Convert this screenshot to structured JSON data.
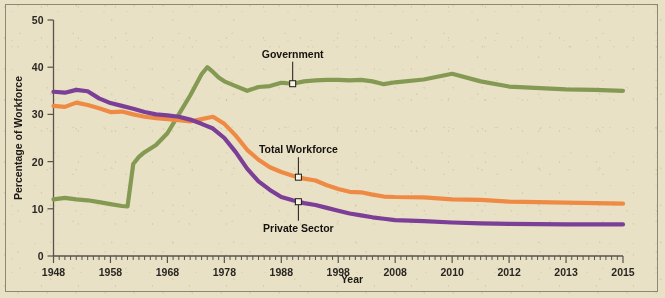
{
  "chart_data": {
    "type": "line",
    "title": "",
    "xlabel": "Year",
    "ylabel": "Percentage of Workforce",
    "ylim": [
      0,
      50
    ],
    "yticks": [
      0,
      10,
      20,
      30,
      40,
      50
    ],
    "ytick_labels": [
      "0",
      "10",
      "20",
      "30",
      "40",
      "50"
    ],
    "xtick_labels": [
      "1948",
      "1958",
      "1968",
      "1978",
      "1988",
      "1998",
      "2008",
      "2010",
      "2012",
      "2013",
      "2015"
    ],
    "grid": false,
    "legend": "inline-annotations",
    "background_color": "#e9e1c6",
    "series": [
      {
        "name": "Government",
        "color": "#849a52",
        "label_text": "Government",
        "x": [
          1948,
          1950,
          1952,
          1954,
          1956,
          1958,
          1960,
          1961,
          1962,
          1963,
          1964,
          1966,
          1968,
          1970,
          1972,
          1974,
          1975,
          1976,
          1977,
          1978,
          1980,
          1982,
          1984,
          1986,
          1988,
          1990,
          1992,
          1994,
          1996,
          1998,
          2000,
          2002,
          2004,
          2006,
          2008,
          2009,
          2010,
          2011,
          2012,
          2013,
          2014,
          2015
        ],
        "values": [
          12.0,
          12.3,
          12.0,
          11.8,
          11.4,
          11.0,
          10.6,
          10.5,
          19.5,
          21.0,
          22.0,
          23.5,
          26.0,
          30.0,
          34.0,
          38.5,
          40.0,
          39.0,
          37.8,
          37.0,
          36.0,
          35.0,
          35.8,
          36.0,
          36.7,
          36.5,
          37.0,
          37.2,
          37.3,
          37.3,
          37.2,
          37.3,
          37.0,
          36.4,
          36.8,
          37.4,
          38.6,
          37.0,
          35.9,
          35.3,
          35.2,
          35.0
        ]
      },
      {
        "name": "Total Workforce",
        "color": "#ef8a44",
        "label_text": "Total Workforce",
        "x": [
          1948,
          1950,
          1952,
          1954,
          1956,
          1958,
          1960,
          1962,
          1964,
          1966,
          1968,
          1970,
          1972,
          1974,
          1976,
          1978,
          1980,
          1982,
          1984,
          1986,
          1988,
          1990,
          1992,
          1994,
          1996,
          1998,
          2000,
          2002,
          2004,
          2006,
          2008,
          2009,
          2010,
          2011,
          2012,
          2013,
          2014,
          2015
        ],
        "values": [
          31.8,
          31.6,
          32.5,
          32.0,
          31.3,
          30.5,
          30.6,
          30.0,
          29.5,
          29.2,
          29.0,
          28.8,
          28.5,
          29.0,
          29.5,
          28.0,
          25.5,
          22.5,
          20.4,
          18.8,
          17.8,
          17.0,
          16.4,
          16.0,
          15.0,
          14.2,
          13.6,
          13.5,
          13.0,
          12.6,
          12.5,
          12.4,
          12.0,
          11.9,
          11.5,
          11.3,
          11.2,
          11.1
        ]
      },
      {
        "name": "Private Sector",
        "color": "#7b3f97",
        "label_text": "Private Sector",
        "x": [
          1948,
          1950,
          1952,
          1954,
          1956,
          1958,
          1960,
          1962,
          1964,
          1966,
          1968,
          1970,
          1972,
          1974,
          1976,
          1978,
          1980,
          1982,
          1984,
          1986,
          1988,
          1990,
          1992,
          1994,
          1996,
          1998,
          2000,
          2002,
          2004,
          2006,
          2008,
          2009,
          2010,
          2011,
          2012,
          2013,
          2014,
          2015
        ],
        "values": [
          34.8,
          34.6,
          35.2,
          34.9,
          33.4,
          32.4,
          31.8,
          31.2,
          30.5,
          30.0,
          29.8,
          29.5,
          28.9,
          28.0,
          27.0,
          25.0,
          22.0,
          18.5,
          15.8,
          14.0,
          12.5,
          11.8,
          11.2,
          10.8,
          10.2,
          9.6,
          9.0,
          8.6,
          8.2,
          7.9,
          7.6,
          7.4,
          7.1,
          6.9,
          6.8,
          6.7,
          6.7,
          6.7
        ]
      }
    ],
    "annotations": [
      {
        "series": "Government",
        "text": "Government",
        "point_year": 1990,
        "point_value": 36.5
      },
      {
        "series": "Total Workforce",
        "text": "Total Workforce",
        "point_year": 1991,
        "point_value": 16.7
      },
      {
        "series": "Private Sector",
        "text": "Private Sector",
        "point_year": 1991,
        "point_value": 11.5
      }
    ]
  }
}
